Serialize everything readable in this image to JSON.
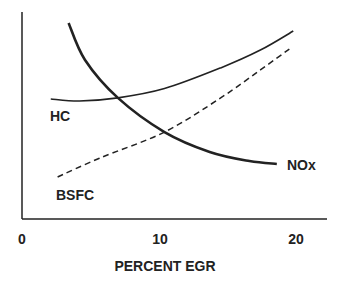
{
  "chart_data": {
    "type": "line",
    "title": "",
    "xlabel": "PERCENT EGR",
    "ylabel": "",
    "xlim": [
      0,
      22
    ],
    "ylim": [
      0,
      100
    ],
    "x_ticks": [
      "0",
      "10",
      "20"
    ],
    "grid": false,
    "legend": "inline labels",
    "series": [
      {
        "name": "HC",
        "style": "solid-thin",
        "x": [
          2.1,
          4.2,
          7.0,
          10.4,
          14.5,
          17.4,
          19.8
        ],
        "y": [
          58,
          57,
          58.5,
          63,
          73,
          81.6,
          90.8
        ]
      },
      {
        "name": "NOx",
        "style": "solid-thick",
        "x": [
          3.4,
          4.6,
          7.0,
          10.4,
          13.7,
          16.6,
          18.6
        ],
        "y": [
          94.7,
          76.8,
          58.5,
          42,
          32.4,
          28,
          26.6
        ]
      },
      {
        "name": "BSFC",
        "style": "dashed",
        "x": [
          2.6,
          5.7,
          10.4,
          14.5,
          17.4,
          19.7
        ],
        "y": [
          20.3,
          29.5,
          42,
          58.5,
          72,
          83
        ]
      }
    ]
  }
}
